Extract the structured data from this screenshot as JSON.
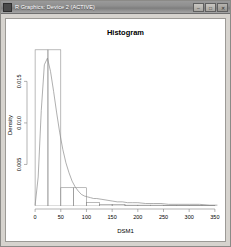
{
  "window": {
    "title": "R Graphics: Device 2 (ACTIVE)",
    "icon": "r-graphics-icon",
    "controls": [
      {
        "name": "minimize-button",
        "glyph": "–"
      },
      {
        "name": "maximize-button",
        "glyph": "□"
      },
      {
        "name": "close-button",
        "glyph": "✕"
      }
    ]
  },
  "chart_data": {
    "type": "bar",
    "title": "Histogram",
    "xlabel": "DSM1",
    "ylabel": "Density",
    "grid": false,
    "legend": null,
    "xlim": [
      -8,
      360
    ],
    "ylim": [
      0,
      0.0195
    ],
    "xticks": [
      0,
      50,
      100,
      150,
      200,
      250,
      300,
      350
    ],
    "xticklabels": [
      "0",
      "50",
      "100",
      "150",
      "200",
      "250",
      "300",
      "350"
    ],
    "yticks": [
      0.005,
      0.01,
      0.015
    ],
    "yticklabels": [
      "0.005",
      "0.010",
      "0.015"
    ],
    "bin_width": 25,
    "bin_edges": [
      0,
      25,
      50,
      75,
      100,
      125,
      150,
      175,
      200,
      225,
      250,
      275,
      300,
      325,
      350
    ],
    "categories": [
      "0-25",
      "25-50",
      "50-75",
      "75-100",
      "100-125",
      "125-150",
      "150-175",
      "175-200",
      "200-225",
      "225-250",
      "250-275",
      "275-300",
      "300-325",
      "325-350"
    ],
    "values": [
      0.0188,
      0.0188,
      0.0022,
      0.0022,
      0.0004,
      0.0002,
      0.0002,
      0.0001,
      0.0001,
      0.0001,
      5e-05,
      5e-05,
      5e-05,
      5e-05
    ],
    "series": [
      {
        "name": "Histogram",
        "type": "bar",
        "values": [
          0.0188,
          0.0188,
          0.0022,
          0.0022,
          0.0004,
          0.0002,
          0.0002,
          0.0001,
          0.0001,
          0.0001,
          5e-05,
          5e-05,
          5e-05,
          5e-05
        ]
      },
      {
        "name": "Density",
        "type": "line",
        "x": [
          0,
          6,
          12,
          18,
          24,
          30,
          36,
          42,
          48,
          54,
          60,
          66,
          72,
          78,
          84,
          90,
          96,
          102,
          108,
          114,
          120,
          130,
          140,
          150,
          160,
          170,
          180,
          190,
          200,
          215,
          230,
          245,
          260,
          280,
          300,
          320,
          340,
          355
        ],
        "y": [
          0.0001,
          0.0035,
          0.0115,
          0.017,
          0.0178,
          0.0162,
          0.0138,
          0.0112,
          0.0088,
          0.0068,
          0.0052,
          0.004,
          0.003,
          0.0023,
          0.0018,
          0.0014,
          0.0012,
          0.0011,
          0.001,
          0.0009,
          0.0009,
          0.0008,
          0.0007,
          0.0006,
          0.0005,
          0.0005,
          0.0004,
          0.0004,
          0.0004,
          0.0003,
          0.0003,
          0.0003,
          0.0002,
          0.0002,
          0.0002,
          0.0002,
          0.0001,
          0.0001
        ]
      }
    ]
  }
}
